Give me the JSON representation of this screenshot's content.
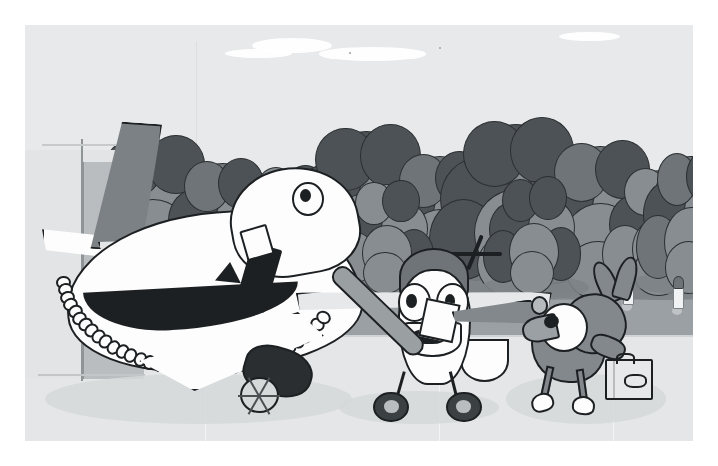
{
  "scene": {
    "title": "Cartoon airport illustration",
    "style": "grayscale cartoon line art",
    "palette": {
      "sky": "#e7e9ea",
      "cloud": "#ffffff",
      "ground_far": "#8d9296",
      "ground_mid": "#9aa0a3",
      "apron": "#e4e6e7",
      "outline": "#1d2022",
      "tree_mid": "#6e7478",
      "tree_dark": "#4d5256",
      "tree_light": "#878d91",
      "body_gray": "#82888c",
      "white": "#fdfdfd"
    },
    "border_color": "#ffffff"
  },
  "sky": {
    "label": "sky",
    "clouds": [
      "cloud-large",
      "cloud-wisp",
      "cloud-small",
      "cloud-far-right"
    ],
    "specks": 2
  },
  "background": {
    "treeline_label": "row of broadleaf trees",
    "tree_count": 12,
    "trees": [
      {
        "name": "tree-1",
        "x": 9.5,
        "y": 22,
        "w": 19,
        "h": 38,
        "tone": "dark"
      },
      {
        "name": "tree-2",
        "x": 22,
        "y": 28,
        "w": 15,
        "h": 33,
        "tone": "mid"
      },
      {
        "name": "tree-3",
        "x": 33,
        "y": 30,
        "w": 13,
        "h": 30,
        "tone": "light"
      },
      {
        "name": "tree-4",
        "x": 41,
        "y": 19,
        "w": 20,
        "h": 41,
        "tone": "dark"
      },
      {
        "name": "tree-5",
        "x": 54,
        "y": 26,
        "w": 16,
        "h": 35,
        "tone": "mid"
      },
      {
        "name": "tree-6",
        "x": 63,
        "y": 17,
        "w": 21,
        "h": 43,
        "tone": "dark"
      },
      {
        "name": "tree-7",
        "x": 77,
        "y": 23,
        "w": 18,
        "h": 38,
        "tone": "mid"
      },
      {
        "name": "tree-8",
        "x": 88,
        "y": 30,
        "w": 14,
        "h": 31,
        "tone": "light"
      },
      {
        "name": "tree-9",
        "x": 3,
        "y": 34,
        "w": 12,
        "h": 27,
        "tone": "mid"
      },
      {
        "name": "tree-10",
        "x": 48,
        "y": 34,
        "w": 12,
        "h": 27,
        "tone": "light"
      },
      {
        "name": "tree-11",
        "x": 70,
        "y": 33,
        "w": 12,
        "h": 28,
        "tone": "dark"
      },
      {
        "name": "tree-12",
        "x": 93,
        "y": 26,
        "w": 13,
        "h": 34,
        "tone": "mid"
      }
    ],
    "bollards": [
      {
        "name": "bollard-1",
        "x": 9.2,
        "y": 62.5
      },
      {
        "name": "bollard-2",
        "x": 38.5,
        "y": 63.5
      },
      {
        "name": "bollard-3",
        "x": 61.5,
        "y": 63.0
      },
      {
        "name": "bollard-4",
        "x": 89.5,
        "y": 61.5
      },
      {
        "name": "bollard-5",
        "x": 97.0,
        "y": 62.5
      }
    ]
  },
  "hangar": {
    "label": "terminal building",
    "parts": [
      "front-wall",
      "side-wall",
      "roof-line",
      "base-line"
    ]
  },
  "airliner": {
    "label": "big cartoon airliner",
    "parts": [
      "fuselage",
      "nose",
      "cockpit-eye",
      "passenger-door",
      "cheatline-stripe",
      "cabin-windows",
      "tail-fin",
      "tailplane",
      "rear-wing",
      "front-wing",
      "jet-engine",
      "engine-fan"
    ],
    "cabin_window_count": 34,
    "has_face": true
  },
  "smallplane": {
    "label": "small cartoon propeller plane",
    "parts": [
      "fuselage",
      "engine-cowl",
      "propeller",
      "left-eye",
      "right-eye",
      "open-mouth",
      "left-wing",
      "right-wing",
      "tail",
      "nose-strut",
      "left-wheel",
      "right-wheel",
      "baseball-bat",
      "fuselage-badge"
    ],
    "registration_mark": "N-mark",
    "expression": "surprised",
    "wheel_count": 2
  },
  "kangaroo": {
    "label": "cartoon kangaroo traveller",
    "parts": [
      "head",
      "muzzle",
      "eye",
      "left-ear",
      "right-ear",
      "body",
      "arm",
      "tail",
      "tail-tip",
      "left-leg",
      "right-leg",
      "left-foot",
      "right-foot"
    ],
    "carrying": "suitcase",
    "suitcase_parts": [
      "handle",
      "latch-strip",
      "label-oval"
    ]
  },
  "foreground": {
    "apron_label": "concrete apron",
    "seam_lines": 3,
    "shadows": [
      "airliner-shadow",
      "smallplane-shadow",
      "kangaroo-shadow",
      "tree-shadows"
    ]
  }
}
